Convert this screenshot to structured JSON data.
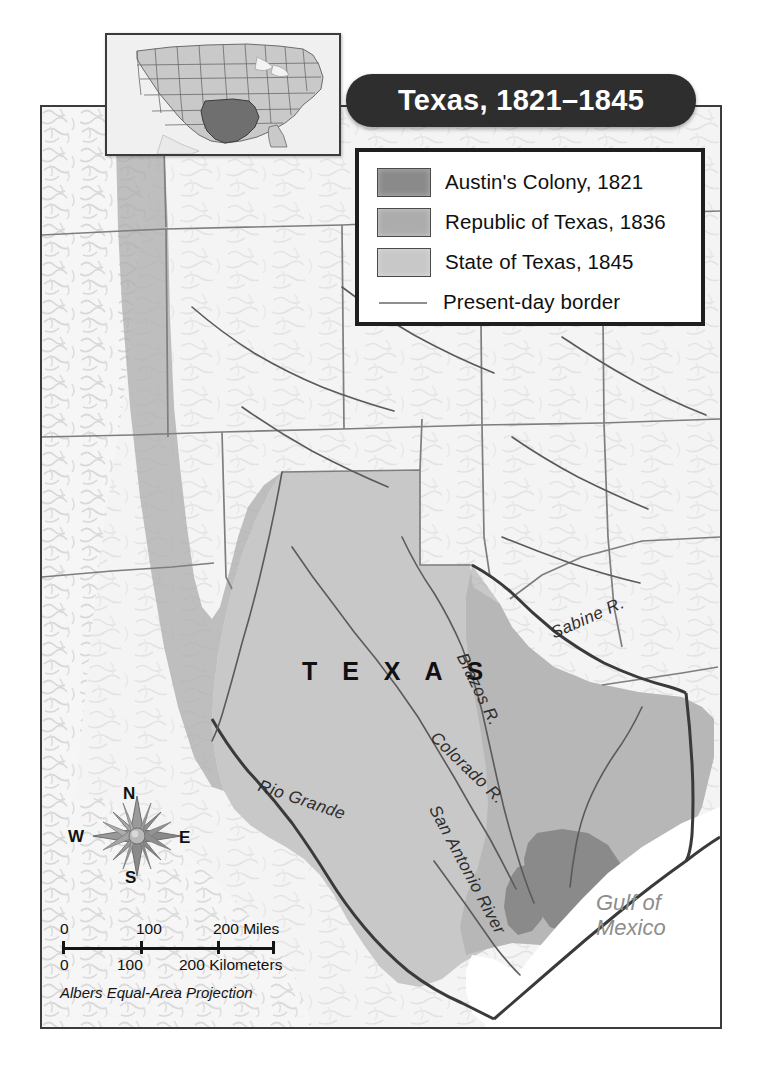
{
  "title": {
    "text": "Texas, 1821–1845"
  },
  "inset": {
    "name": "united-states-locator-inset",
    "highlighted_state": "Texas",
    "highlight_color": "#6f6f6f",
    "state_fill": "#c9c9c9",
    "background": "#f0f0f0"
  },
  "legend": {
    "items": [
      {
        "label": "Austin's Colony, 1821",
        "color": "#8a8a8a",
        "type": "swatch"
      },
      {
        "label": "Republic of Texas, 1836",
        "color": "#acacac",
        "type": "swatch"
      },
      {
        "label": "State of Texas, 1845",
        "color": "#c8c8c8",
        "type": "swatch"
      },
      {
        "label": "Present-day border",
        "color": "#8e8e8e",
        "type": "line"
      }
    ]
  },
  "map_labels": {
    "texas": "T E X A S",
    "gulf_line1": "Gulf of",
    "gulf_line2": "Mexico",
    "rivers": {
      "sabine": "Sabine R.",
      "brazos": "Brazos R.",
      "colorado": "Colorado R.",
      "san_antonio": "San Antonio River",
      "rio_grande": "Rio  Grande"
    }
  },
  "compass": {
    "north": "N",
    "west": "W",
    "east": "E",
    "south": "S"
  },
  "scale": {
    "miles": {
      "t0": "0",
      "t1": "100",
      "t2": "200 Miles"
    },
    "kilometers": {
      "t0": "0",
      "t1": "100",
      "t2": "200 Kilometers"
    },
    "projection": "Albers Equal-Area Projection"
  },
  "colors": {
    "austins_colony": "#8a8a8a",
    "republic_of_texas": "#acacac",
    "state_of_texas": "#c8c8c8",
    "land": "#f4f4f4",
    "water": "#ffffff",
    "border": "#6d6d6d",
    "present_day_border": "#3a3a3a",
    "frame": "#3b3b3b",
    "banner": "#2e2e2e"
  }
}
